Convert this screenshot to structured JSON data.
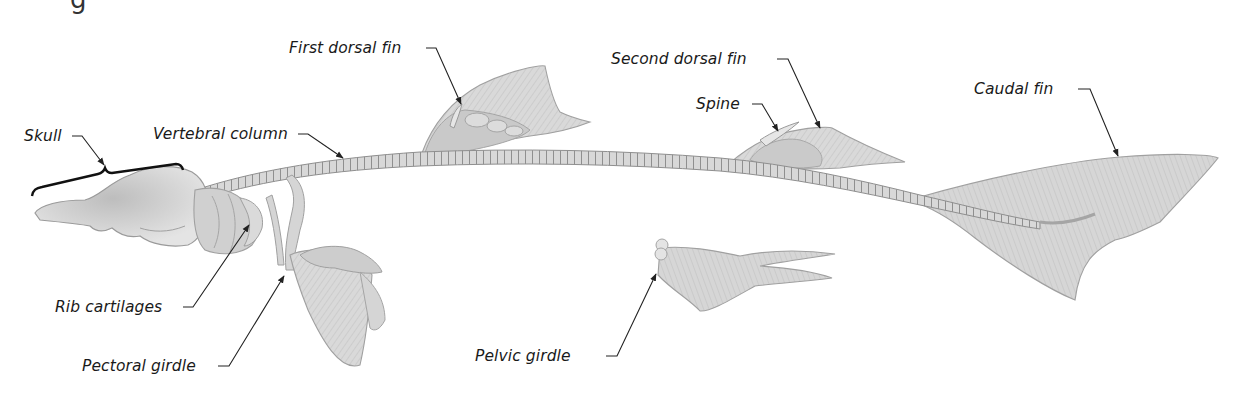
{
  "diagram": {
    "heading_fragment": "g",
    "labels": [
      {
        "id": "skull",
        "text": "Skull"
      },
      {
        "id": "vertebral-column",
        "text": "Vertebral column"
      },
      {
        "id": "first-dorsal-fin",
        "text": "First dorsal fin"
      },
      {
        "id": "second-dorsal-fin",
        "text": "Second dorsal fin"
      },
      {
        "id": "spine",
        "text": "Spine"
      },
      {
        "id": "caudal-fin",
        "text": "Caudal fin"
      },
      {
        "id": "rib-cartilages",
        "text": "Rib cartilages"
      },
      {
        "id": "pectoral-girdle",
        "text": "Pectoral girdle"
      },
      {
        "id": "pelvic-girdle",
        "text": "Pelvic girdle"
      }
    ],
    "colors": {
      "background": "#ffffff",
      "cartilage_light": "#e2e2e2",
      "cartilage_mid": "#cfcfcf",
      "cartilage_dark": "#b5b5b5",
      "outline": "#9a9a9a",
      "leader_line": "#222222",
      "label_text": "#1a1a1a"
    }
  }
}
